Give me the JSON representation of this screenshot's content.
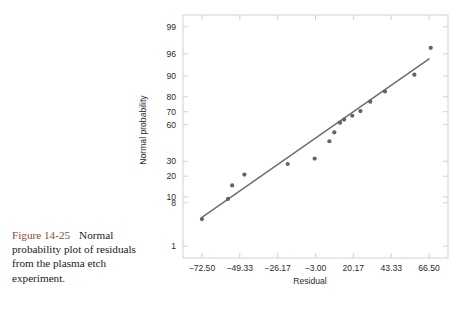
{
  "caption": {
    "figure_number": "Figure 14-25",
    "text": "Normal probability plot of residuals from the plasma etch experiment.",
    "figure_number_color": "#8c4a3c",
    "text_color": "#1a1a1a"
  },
  "chart_data": {
    "type": "scatter",
    "title": "",
    "xlabel": "Residual",
    "ylabel": "Normal probability",
    "grid": false,
    "legend": "none",
    "xlim": [
      -84.08,
      78.08
    ],
    "xticks": [
      -72.5,
      -49.33,
      -26.17,
      -3.0,
      20.17,
      43.33,
      66.5
    ],
    "xtick_labels": [
      "−72.50",
      "−49.33",
      "−26.17",
      "−3.00",
      "20.17",
      "43.33",
      "66.50"
    ],
    "yscale": "normal-probability",
    "yticks": [
      1,
      8,
      10,
      20,
      30,
      60,
      70,
      80,
      90,
      96,
      99
    ],
    "ytick_labels": [
      "1",
      "8",
      "10",
      "20",
      "30",
      "60",
      "70",
      "80",
      "90",
      "96",
      "99"
    ],
    "ylim": [
      0.5,
      99.5
    ],
    "point_color": "#636363",
    "line_color": "#6e6e6e",
    "frame_color": "#d2d2d2",
    "points": [
      {
        "x": -72.5,
        "y": 4.0
      },
      {
        "x": -56.5,
        "y": 9.3
      },
      {
        "x": -54.0,
        "y": 15.0
      },
      {
        "x": -46.5,
        "y": 21.0
      },
      {
        "x": -20.0,
        "y": 28.0
      },
      {
        "x": -3.5,
        "y": 32.0
      },
      {
        "x": 5.5,
        "y": 46.0
      },
      {
        "x": 8.5,
        "y": 53.5
      },
      {
        "x": 12.0,
        "y": 61.5
      },
      {
        "x": 14.5,
        "y": 64.0
      },
      {
        "x": 19.5,
        "y": 67.0
      },
      {
        "x": 24.5,
        "y": 70.5
      },
      {
        "x": 30.5,
        "y": 77.0
      },
      {
        "x": 39.5,
        "y": 83.0
      },
      {
        "x": 57.5,
        "y": 90.5
      },
      {
        "x": 67.5,
        "y": 97.0
      }
    ],
    "reference_line": {
      "x1": -72.5,
      "y1": 4.3,
      "x2": 66.5,
      "y2": 95.0
    }
  }
}
